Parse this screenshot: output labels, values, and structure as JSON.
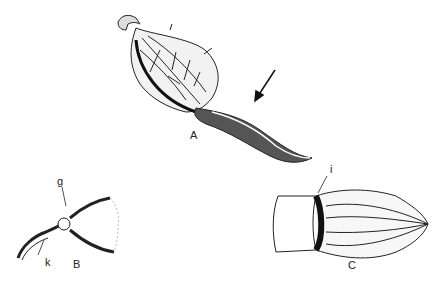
{
  "figure": {
    "panels": [
      {
        "id": "A",
        "label": "A",
        "description": "Elongated seed pod with netted/veined inflated body and long curved tail"
      },
      {
        "id": "B",
        "label": "B",
        "description": "Opened pod base showing hooked attachment",
        "callouts": [
          "g",
          "k"
        ]
      },
      {
        "id": "C",
        "label": "C",
        "description": "Ribbed capsule with opened end",
        "callouts": [
          "i"
        ]
      }
    ],
    "labels": {
      "A": "A",
      "B": "B",
      "C": "C",
      "g": "g",
      "k": "k",
      "i": "i"
    },
    "arrow": {
      "points_to": "A",
      "direction": "down-left"
    },
    "colors": {
      "ink": "#222222",
      "background": "#ffffff"
    }
  }
}
